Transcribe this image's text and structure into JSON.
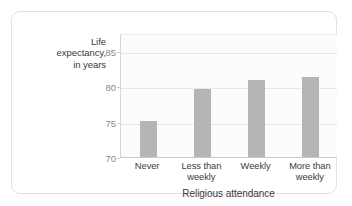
{
  "chart_data": {
    "type": "bar",
    "title": "",
    "subtitle": "",
    "xlabel": "Religious attendance",
    "ylabel": "Life expectancy, in years",
    "ylabel_lines": [
      "Life",
      "expectancy,",
      "in years"
    ],
    "categories": [
      "Never",
      "Less than weekly",
      "Weekly",
      "More than weekly"
    ],
    "category_lines": [
      [
        "Never"
      ],
      [
        "Less than",
        "weekly"
      ],
      [
        "Weekly"
      ],
      [
        "More than",
        "weekly"
      ]
    ],
    "values": [
      75.2,
      79.8,
      81.0,
      81.5
    ],
    "ylim": [
      70,
      87.5
    ],
    "yticks": [
      70,
      75,
      80,
      85
    ],
    "ytick_labels": [
      "70",
      "75",
      "80",
      "85"
    ],
    "grid": true,
    "grid_axis": "y",
    "legend": false,
    "legend_position": "none",
    "colors": {
      "bar": "#b5b5b5",
      "gridline": "#e8e8e8",
      "axis": "#c9c9c9",
      "plot_background": "#fcfcfc",
      "tick_text": "#8a8a8a",
      "label_text": "#3b3b3b",
      "card_border": "#e2e2e2",
      "page_background": "#ffffff"
    }
  }
}
